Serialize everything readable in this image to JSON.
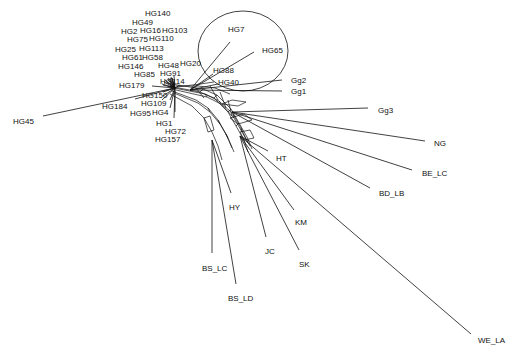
{
  "diagram": {
    "type": "phylogenetic-network",
    "hub": {
      "x": 175,
      "y": 88
    },
    "highlight_circle": {
      "cx": 243,
      "cy": 51,
      "rx": 45,
      "ry": 40
    },
    "taxa": [
      {
        "label": "HG140",
        "lx": 145,
        "ly": 16,
        "ex": 172,
        "ey": 78
      },
      {
        "label": "HG49",
        "lx": 132,
        "ly": 25,
        "ex": 170,
        "ey": 78
      },
      {
        "label": "HG2",
        "lx": 121,
        "ly": 34,
        "ex": 168,
        "ey": 78
      },
      {
        "label": "HG16",
        "lx": 140,
        "ly": 33,
        "ex": 171,
        "ey": 77
      },
      {
        "label": "HG103",
        "lx": 162,
        "ly": 33,
        "ex": 174,
        "ey": 76
      },
      {
        "label": "HG75",
        "lx": 127,
        "ly": 42,
        "ex": 168,
        "ey": 80
      },
      {
        "label": "HG110",
        "lx": 149,
        "ly": 41,
        "ex": 172,
        "ey": 78
      },
      {
        "label": "HG25",
        "lx": 115,
        "ly": 52,
        "ex": 165,
        "ey": 80
      },
      {
        "label": "HG113",
        "lx": 139,
        "ly": 51,
        "ex": 170,
        "ey": 80
      },
      {
        "label": "HG61",
        "lx": 122,
        "ly": 60,
        "ex": 164,
        "ey": 82
      },
      {
        "label": "HG58",
        "lx": 142,
        "ly": 60,
        "ex": 167,
        "ey": 82
      },
      {
        "label": "HG146",
        "lx": 118,
        "ly": 69,
        "ex": 162,
        "ey": 84
      },
      {
        "label": "HG48",
        "lx": 158,
        "ly": 68,
        "ex": 170,
        "ey": 84
      },
      {
        "label": "HG20",
        "lx": 180,
        "ly": 66,
        "ex": 180,
        "ey": 85
      },
      {
        "label": "HG85",
        "lx": 134,
        "ly": 77,
        "ex": 163,
        "ey": 85
      },
      {
        "label": "HG91",
        "lx": 160,
        "ly": 76,
        "ex": 170,
        "ey": 86
      },
      {
        "label": "HG179",
        "lx": 119,
        "ly": 88,
        "ex": 152,
        "ey": 86
      },
      {
        "label": "HG114",
        "lx": 160,
        "ly": 84,
        "ex": 170,
        "ey": 88
      },
      {
        "label": "HG150",
        "lx": 142,
        "ly": 98,
        "ex": 163,
        "ey": 92
      },
      {
        "label": "HG184",
        "lx": 102,
        "ly": 109,
        "ex": 135,
        "ey": 99
      },
      {
        "label": "HG109",
        "lx": 141,
        "ly": 106,
        "ex": 163,
        "ey": 96
      },
      {
        "label": "HG95",
        "lx": 130,
        "ly": 116,
        "ex": 162,
        "ey": 100
      },
      {
        "label": "HG4",
        "lx": 152,
        "ly": 115,
        "ex": 170,
        "ey": 100
      },
      {
        "label": "HG1",
        "lx": 156,
        "ly": 126,
        "ex": 170,
        "ey": 108
      },
      {
        "label": "HG72",
        "lx": 165,
        "ly": 134,
        "ex": 175,
        "ey": 112
      },
      {
        "label": "HG157",
        "lx": 155,
        "ly": 142,
        "ex": 174,
        "ey": 118
      },
      {
        "label": "HG45",
        "lx": 13,
        "ly": 124,
        "ex": 43,
        "ey": 116
      },
      {
        "label": "HG7",
        "lx": 228,
        "ly": 32,
        "ex": 230,
        "ey": 42
      },
      {
        "label": "HG65",
        "lx": 262,
        "ly": 53,
        "ex": 254,
        "ey": 52
      },
      {
        "label": "HG88",
        "lx": 213,
        "ly": 73,
        "ex": 213,
        "ey": 74
      },
      {
        "label": "HG40",
        "lx": 218,
        "ly": 85,
        "ex": 218,
        "ey": 84
      },
      {
        "label": "Gg2",
        "lx": 291,
        "ly": 83,
        "ex": 282,
        "ey": 80
      },
      {
        "label": "Gg1",
        "lx": 291,
        "ly": 94,
        "ex": 282,
        "ey": 91
      },
      {
        "label": "Gg3",
        "lx": 378,
        "ly": 113,
        "ex": 368,
        "ey": 108
      },
      {
        "label": "NG",
        "lx": 434,
        "ly": 146,
        "ex": 425,
        "ey": 141
      },
      {
        "label": "BE_LC",
        "lx": 422,
        "ly": 176,
        "ex": 412,
        "ey": 170
      },
      {
        "label": "BD_LB",
        "lx": 379,
        "ly": 196,
        "ex": 370,
        "ey": 188
      },
      {
        "label": "HT",
        "lx": 276,
        "ly": 161,
        "ex": 268,
        "ey": 151
      },
      {
        "label": "HY",
        "lx": 229,
        "ly": 210,
        "ex": 231,
        "ey": 193
      },
      {
        "label": "KM",
        "lx": 295,
        "ly": 225,
        "ex": 294,
        "ey": 210
      },
      {
        "label": "JC",
        "lx": 265,
        "ly": 254,
        "ex": 266,
        "ey": 237
      },
      {
        "label": "SK",
        "lx": 299,
        "ly": 267,
        "ex": 299,
        "ey": 250
      },
      {
        "label": "BS_LC",
        "lx": 202,
        "ly": 271,
        "ex": 212,
        "ey": 253
      },
      {
        "label": "BS_LD",
        "lx": 228,
        "ly": 301,
        "ex": 236,
        "ey": 284
      },
      {
        "label": "WE_LA",
        "lx": 478,
        "ly": 343,
        "ex": 471,
        "ey": 334
      }
    ]
  }
}
